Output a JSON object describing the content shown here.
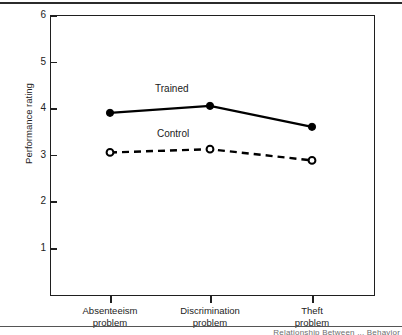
{
  "figure": {
    "y_axis_title": "Performance rating",
    "caption_partial": "Relationship Between ... Behavior",
    "series_labels": {
      "trained": "Trained",
      "control": "Control"
    }
  },
  "chart_data": {
    "type": "line",
    "title": "",
    "xlabel": "",
    "ylabel": "Performance rating",
    "categories": [
      "Absenteeism problem",
      "Discrimination problem",
      "Theft problem"
    ],
    "category_lines": [
      [
        "Absenteeism",
        "problem"
      ],
      [
        "Discrimination",
        "problem"
      ],
      [
        "Theft",
        "problem"
      ]
    ],
    "series": [
      {
        "name": "Trained",
        "values": [
          3.9,
          4.05,
          3.6
        ],
        "line_style": "solid",
        "marker": "filled-circle",
        "color": "#000000"
      },
      {
        "name": "Control",
        "values": [
          3.05,
          3.12,
          2.88
        ],
        "line_style": "dashed",
        "marker": "open-circle",
        "color": "#000000"
      }
    ],
    "ylim": [
      0.5,
      6
    ],
    "yticks": [
      1,
      2,
      3,
      4,
      5,
      6
    ],
    "ytick_labels": [
      "1",
      "2",
      "3",
      "4",
      "5",
      "6"
    ],
    "grid": false,
    "legend": "inline-labels"
  },
  "colors": {
    "axis": "#1f1f1f",
    "series": "#000000",
    "rule": "#2b2b2b",
    "background": "#ffffff"
  }
}
